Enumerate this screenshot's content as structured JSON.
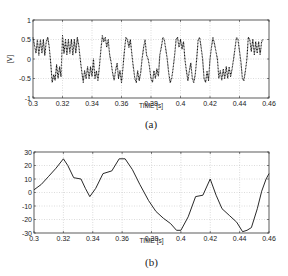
{
  "chart_data": [
    {
      "id": "a",
      "type": "line",
      "caption": "(a)",
      "title": "",
      "xlabel": "TIME  [s]",
      "ylabel": "[V]",
      "xlim": [
        0.3,
        0.46
      ],
      "ylim": [
        -1,
        1
      ],
      "xticks": [
        "0.3",
        "0.32",
        "0.34",
        "0.36",
        "0.38",
        "0.4",
        "0.42",
        "0.44",
        "0.46"
      ],
      "yticks": [
        "1",
        "0.5",
        "0",
        "-0.5",
        "-1"
      ],
      "grid": true,
      "line_style": "dotted",
      "series": [
        {
          "name": "voltage",
          "x": [
            0.3,
            0.302,
            0.303,
            0.304,
            0.305,
            0.306,
            0.307,
            0.308,
            0.309,
            0.31,
            0.311,
            0.312,
            0.313,
            0.314,
            0.315,
            0.316,
            0.317,
            0.318,
            0.319,
            0.32,
            0.321,
            0.322,
            0.323,
            0.324,
            0.325,
            0.326,
            0.327,
            0.328,
            0.329,
            0.33,
            0.331,
            0.332,
            0.333,
            0.334,
            0.335,
            0.336,
            0.337,
            0.338,
            0.339,
            0.34,
            0.341,
            0.342,
            0.343,
            0.344,
            0.345,
            0.346,
            0.347,
            0.348,
            0.349,
            0.35,
            0.351,
            0.352,
            0.353,
            0.354,
            0.355,
            0.356,
            0.357,
            0.358,
            0.359,
            0.36,
            0.361,
            0.362,
            0.363,
            0.364,
            0.365,
            0.366,
            0.367,
            0.368,
            0.369,
            0.37,
            0.371,
            0.372,
            0.373,
            0.374,
            0.375,
            0.376,
            0.377,
            0.378,
            0.379,
            0.38,
            0.381,
            0.382,
            0.383,
            0.384,
            0.385,
            0.386,
            0.387,
            0.388,
            0.389,
            0.39,
            0.391,
            0.392,
            0.393,
            0.394,
            0.395,
            0.396,
            0.397,
            0.398,
            0.399,
            0.4,
            0.401,
            0.402,
            0.403,
            0.404,
            0.405,
            0.406,
            0.407,
            0.408,
            0.409,
            0.41,
            0.411,
            0.412,
            0.413,
            0.414,
            0.415,
            0.416,
            0.417,
            0.418,
            0.419,
            0.42,
            0.421,
            0.422,
            0.423,
            0.424,
            0.425,
            0.426,
            0.427,
            0.428,
            0.429,
            0.43,
            0.431,
            0.432,
            0.433,
            0.434,
            0.435,
            0.436,
            0.437,
            0.438,
            0.439,
            0.44,
            0.441,
            0.442,
            0.443,
            0.444,
            0.445,
            0.446,
            0.447,
            0.448,
            0.449,
            0.45,
            0.451,
            0.452,
            0.453,
            0.454,
            0.455,
            0.456,
            0.457,
            0.458,
            0.459,
            0.46
          ],
          "y": [
            0.55,
            0.15,
            0.5,
            0.1,
            0.5,
            0.15,
            0.5,
            0.1,
            0.45,
            0.55,
            0.3,
            -0.1,
            -0.6,
            -0.4,
            -0.55,
            -0.15,
            -0.5,
            -0.2,
            -0.45,
            0.6,
            0.15,
            0.5,
            0.1,
            0.5,
            0.15,
            0.5,
            0.1,
            0.5,
            0.15,
            0.55,
            0.35,
            0.0,
            -0.3,
            -0.6,
            -0.3,
            -0.5,
            -0.2,
            -0.5,
            -0.2,
            -0.45,
            0.0,
            -0.5,
            -0.3,
            -0.55,
            -0.2,
            0.2,
            0.6,
            0.45,
            0.55,
            0.3,
            0.5,
            0.1,
            -0.1,
            -0.35,
            -0.55,
            -0.3,
            -0.1,
            -0.5,
            -0.3,
            -0.6,
            -0.2,
            0.2,
            0.55,
            0.5,
            0.3,
            0.5,
            0.15,
            -0.2,
            -0.5,
            -0.6,
            -0.3,
            -0.55,
            -0.35,
            0.0,
            0.3,
            0.5,
            0.1,
            0.0,
            -0.2,
            -0.5,
            -0.6,
            -0.3,
            -0.5,
            -0.25,
            -0.45,
            0.1,
            0.3,
            0.55,
            0.5,
            0.25,
            0.0,
            -0.35,
            -0.6,
            -0.5,
            -0.25,
            0.1,
            0.5,
            0.55,
            0.3,
            0.5,
            0.25,
            0.45,
            0.0,
            -0.3,
            -0.55,
            -0.3,
            -0.1,
            -0.5,
            -0.6,
            -0.4,
            0.0,
            0.5,
            0.55,
            0.3,
            0.0,
            -0.5,
            -0.6,
            -0.3,
            -0.55,
            0.0,
            0.3,
            0.55,
            0.4,
            0.2,
            0.0,
            -0.5,
            -0.3,
            -0.55,
            -0.25,
            -0.5,
            -0.2,
            -0.5,
            -0.2,
            -0.45,
            -0.25,
            0.0,
            0.3,
            0.55,
            0.5,
            0.2,
            -0.1,
            -0.5,
            -0.55,
            -0.3,
            0.0,
            0.55,
            0.5,
            0.2,
            0.5,
            0.1,
            0.45,
            0.15,
            0.45,
            0.1,
            0.45,
            0.5
          ]
        }
      ]
    },
    {
      "id": "b",
      "type": "line",
      "caption": "(b)",
      "title": "",
      "xlabel": "TIME  [s]",
      "ylabel": "",
      "xlim": [
        0.3,
        0.46
      ],
      "ylim": [
        -30,
        30
      ],
      "xticks": [
        "0.3",
        "0.32",
        "0.34",
        "0.36",
        "0.38",
        "0.4",
        "0.42",
        "0.44",
        "0.46"
      ],
      "yticks": [
        "30",
        "20",
        "10",
        "0",
        "-10",
        "-20",
        "-30"
      ],
      "grid": true,
      "line_style": "solid",
      "series": [
        {
          "name": "signal",
          "x": [
            0.3,
            0.305,
            0.31,
            0.315,
            0.32,
            0.323,
            0.327,
            0.332,
            0.335,
            0.338,
            0.342,
            0.347,
            0.353,
            0.358,
            0.362,
            0.367,
            0.372,
            0.378,
            0.383,
            0.388,
            0.393,
            0.397,
            0.4,
            0.405,
            0.41,
            0.415,
            0.42,
            0.424,
            0.428,
            0.433,
            0.438,
            0.442,
            0.445,
            0.448,
            0.452,
            0.455,
            0.458,
            0.46
          ],
          "y": [
            2,
            6,
            12,
            18,
            25,
            20,
            11,
            10,
            3,
            -3,
            3,
            14,
            16,
            25,
            25,
            17,
            6,
            -6,
            -14,
            -19,
            -23,
            -28,
            -28,
            -18,
            -3,
            -2,
            10,
            -2,
            -12,
            -17,
            -22,
            -29,
            -28,
            -26,
            -12,
            1,
            10,
            14
          ]
        }
      ]
    }
  ]
}
